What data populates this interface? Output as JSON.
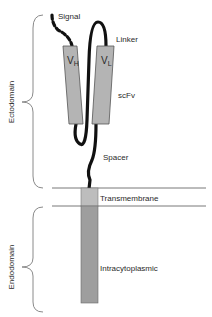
{
  "diagram": {
    "labels": {
      "signal": "Signal",
      "linker": "Linker",
      "scfv": "scFv",
      "spacer": "Spacer",
      "transmembrane": "Transmembrane",
      "intracytoplasmic": "Intracytoplasmic",
      "ectodomain": "Ectodomain",
      "endodomain": "Endodomain",
      "vh_main": "V",
      "vh_sub": "H",
      "vl_main": "V",
      "vl_sub": "L"
    },
    "colors": {
      "domain_box": "#b4b4b4",
      "transmembrane_box": "#bdbdbd",
      "intracytoplasmic_box": "#9e9e9e",
      "chain": "#111111",
      "membrane_line": "#555555",
      "brace": "#8a8a8a",
      "text": "#2a2a2a"
    }
  }
}
